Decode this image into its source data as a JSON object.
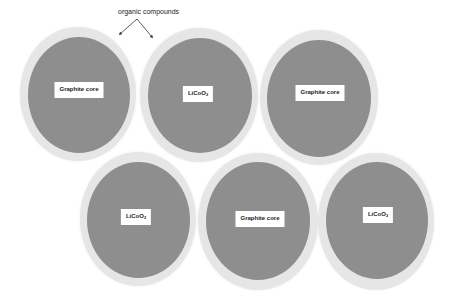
{
  "annotation": {
    "text": "organic compounds",
    "arrow_targets": [
      "top-left particle shell",
      "top-middle particle shell"
    ]
  },
  "colors": {
    "shell": "#e6e6e6",
    "core": "#8e8e8e",
    "label_bg": "#ffffff",
    "text": "#222222"
  },
  "particles": [
    {
      "label": "Graphite core",
      "sub": ""
    },
    {
      "label": "LiCoO",
      "sub": "2"
    },
    {
      "label": "Graphite core",
      "sub": ""
    },
    {
      "label": "LiCoO",
      "sub": "2"
    },
    {
      "label": "Graphite core",
      "sub": ""
    },
    {
      "label": "LiCoO",
      "sub": "2"
    }
  ]
}
